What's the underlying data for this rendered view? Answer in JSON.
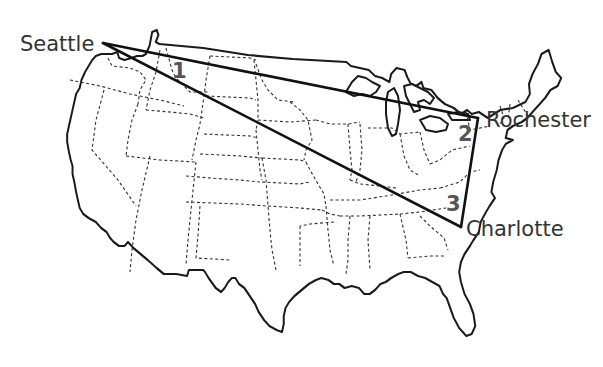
{
  "map": {
    "region": "Contiguous United States",
    "style": {
      "outline_color": "#1a1a1a",
      "state_border_color": "#333333",
      "route_color": "#111111",
      "label_color": "#333333",
      "leg_label_color": "#555555"
    }
  },
  "cities": [
    {
      "name": "Seattle",
      "x": 103,
      "y": 43
    },
    {
      "name": "Rochester",
      "x": 478,
      "y": 118
    },
    {
      "name": "Charlotte",
      "x": 461,
      "y": 227
    }
  ],
  "route": {
    "legs": [
      {
        "number": "1",
        "from": "Seattle",
        "to": "Rochester"
      },
      {
        "number": "2",
        "from": "Rochester",
        "to": "Charlotte"
      },
      {
        "number": "3",
        "from": "Charlotte",
        "to": "Seattle"
      }
    ]
  }
}
